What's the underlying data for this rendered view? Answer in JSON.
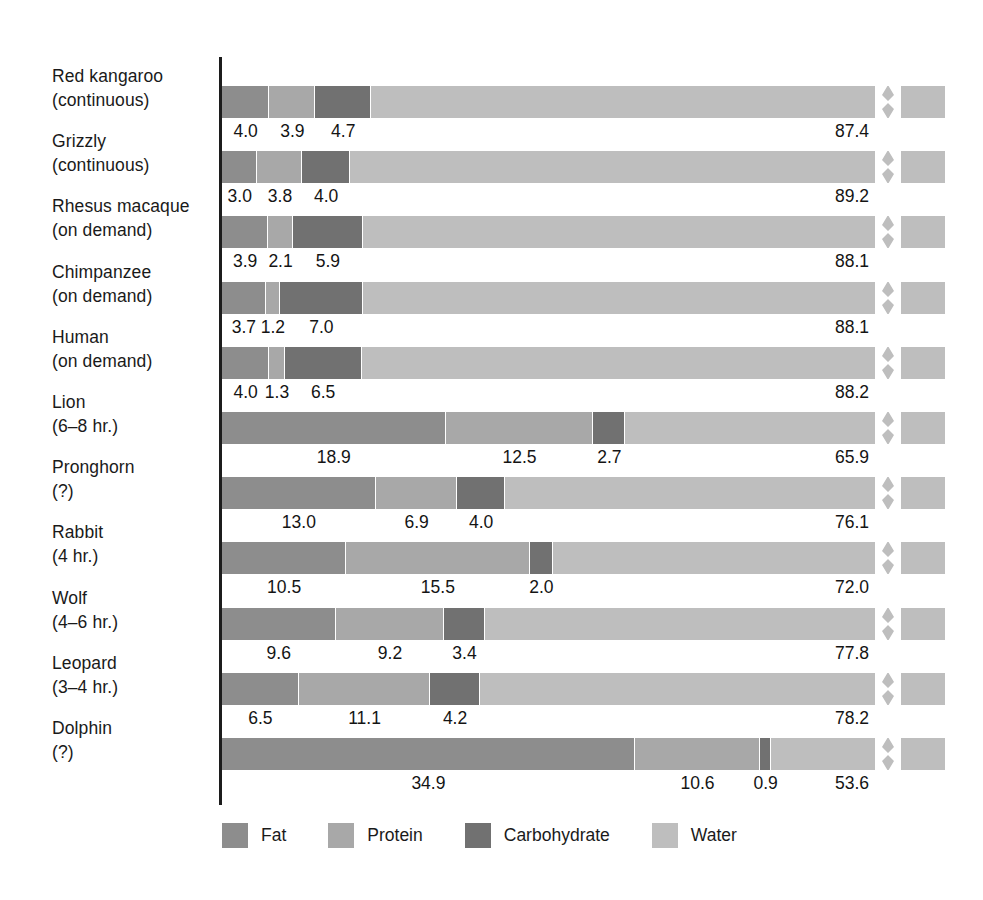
{
  "chart_data": {
    "type": "bar",
    "subtype": "stacked-horizontal-100pct",
    "title": "",
    "xlabel": "",
    "ylabel": "",
    "axis_break": true,
    "axis_break_note": "Each bar is truncated with a zig-zag break near the right end; water segment not drawn to full scale.",
    "legend_position": "bottom",
    "grid": false,
    "series_names": [
      "Fat",
      "Protein",
      "Carbohydrate",
      "Water"
    ],
    "series_colors": [
      "#8d8d8d",
      "#a8a8a8",
      "#717171",
      "#bebebe"
    ],
    "unit": "percent",
    "categories": [
      "Red kangaroo (continuous)",
      "Grizzly (continuous)",
      "Rhesus macaque (on demand)",
      "Chimpanzee (on demand)",
      "Human (on demand)",
      "Lion (6–8 hr.)",
      "Pronghorn (?)",
      "Rabbit (4 hr.)",
      "Wolf (4–6 hr.)",
      "Leopard (3–4 hr.)",
      "Dolphin (?)"
    ],
    "series": [
      {
        "name": "Fat",
        "values": [
          4.0,
          3.0,
          3.9,
          3.7,
          4.0,
          18.9,
          13.0,
          10.5,
          9.6,
          6.5,
          34.9
        ]
      },
      {
        "name": "Protein",
        "values": [
          3.9,
          3.8,
          2.1,
          1.2,
          1.3,
          12.5,
          6.9,
          15.5,
          9.2,
          11.1,
          10.6
        ]
      },
      {
        "name": "Carbohydrate",
        "values": [
          4.7,
          4.0,
          5.9,
          7.0,
          6.5,
          2.7,
          4.0,
          2.0,
          3.4,
          4.2,
          0.9
        ]
      },
      {
        "name": "Water",
        "values": [
          87.4,
          89.2,
          88.1,
          88.1,
          88.2,
          65.9,
          76.1,
          72.0,
          77.8,
          78.2,
          53.6
        ]
      }
    ]
  },
  "rows": [
    {
      "label_line1": "Red kangaroo",
      "label_line2": "(continuous)",
      "values": {
        "fat": "4.0",
        "protein": "3.9",
        "carbohydrate": "4.7",
        "water": "87.4"
      }
    },
    {
      "label_line1": "Grizzly",
      "label_line2": "(continuous)",
      "values": {
        "fat": "3.0",
        "protein": "3.8",
        "carbohydrate": "4.0",
        "water": "89.2"
      }
    },
    {
      "label_line1": "Rhesus macaque",
      "label_line2": "(on demand)",
      "values": {
        "fat": "3.9",
        "protein": "2.1",
        "carbohydrate": "5.9",
        "water": "88.1"
      }
    },
    {
      "label_line1": "Chimpanzee",
      "label_line2": "(on demand)",
      "values": {
        "fat": "3.7",
        "protein": "1.2",
        "carbohydrate": "7.0",
        "water": "88.1"
      }
    },
    {
      "label_line1": "Human",
      "label_line2": "(on demand)",
      "values": {
        "fat": "4.0",
        "protein": "1.3",
        "carbohydrate": "6.5",
        "water": "88.2"
      }
    },
    {
      "label_line1": "Lion",
      "label_line2": "(6–8 hr.)",
      "values": {
        "fat": "18.9",
        "protein": "12.5",
        "carbohydrate": "2.7",
        "water": "65.9"
      }
    },
    {
      "label_line1": "Pronghorn",
      "label_line2": "(?)",
      "values": {
        "fat": "13.0",
        "protein": "6.9",
        "carbohydrate": "4.0",
        "water": "76.1"
      }
    },
    {
      "label_line1": "Rabbit",
      "label_line2": "(4 hr.)",
      "values": {
        "fat": "10.5",
        "protein": "15.5",
        "carbohydrate": "2.0",
        "water": "72.0"
      }
    },
    {
      "label_line1": "Wolf",
      "label_line2": "(4–6 hr.)",
      "values": {
        "fat": "9.6",
        "protein": "9.2",
        "carbohydrate": "3.4",
        "water": "77.8"
      }
    },
    {
      "label_line1": "Leopard",
      "label_line2": "(3–4 hr.)",
      "values": {
        "fat": "6.5",
        "protein": "11.1",
        "carbohydrate": "4.2",
        "water": "78.2"
      }
    },
    {
      "label_line1": "Dolphin",
      "label_line2": "(?)",
      "values": {
        "fat": "34.9",
        "protein": "10.6",
        "carbohydrate": "0.9",
        "water": "53.6"
      }
    }
  ],
  "legend": {
    "items": [
      {
        "label": "Fat",
        "color": "#8d8d8d"
      },
      {
        "label": "Protein",
        "color": "#a8a8a8"
      },
      {
        "label": "Carbohydrate",
        "color": "#717171"
      },
      {
        "label": "Water",
        "color": "#bebebe"
      }
    ]
  }
}
